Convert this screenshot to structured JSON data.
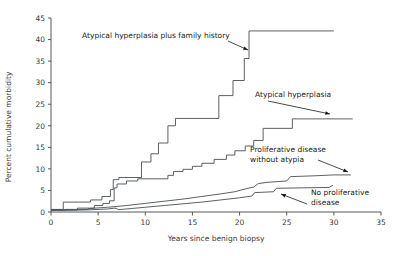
{
  "chart_data": {
    "type": "line",
    "step": true,
    "title": "",
    "xlabel": "Years since benign biopsy",
    "ylabel": "Percent cumulative morbidity",
    "xlim": [
      0,
      35
    ],
    "ylim": [
      0,
      45
    ],
    "xticks": [
      0,
      5,
      10,
      15,
      20,
      25,
      30,
      35
    ],
    "yticks": [
      0,
      5,
      10,
      15,
      20,
      25,
      30,
      35,
      40,
      45
    ],
    "grid": false,
    "legend": "inline annotations with arrows",
    "series": [
      {
        "name": "Atypical hyperplasia plus family history",
        "color": "#4a4e52",
        "points": [
          [
            0,
            0.6
          ],
          [
            1.3,
            0.6
          ],
          [
            1.3,
            2.3
          ],
          [
            4.2,
            2.3
          ],
          [
            4.2,
            2.8
          ],
          [
            5.4,
            2.8
          ],
          [
            5.4,
            3.6
          ],
          [
            6.3,
            3.6
          ],
          [
            6.3,
            5.2
          ],
          [
            6.6,
            5.2
          ],
          [
            6.6,
            7.5
          ],
          [
            7.2,
            7.5
          ],
          [
            7.2,
            8.0
          ],
          [
            9.6,
            8.0
          ],
          [
            9.6,
            11.6
          ],
          [
            10.6,
            11.6
          ],
          [
            10.6,
            13.5
          ],
          [
            11.4,
            13.5
          ],
          [
            11.4,
            16.0
          ],
          [
            12.4,
            16.0
          ],
          [
            12.4,
            20.0
          ],
          [
            13.2,
            20.0
          ],
          [
            13.2,
            21.7
          ],
          [
            17.8,
            21.7
          ],
          [
            17.8,
            27.0
          ],
          [
            19.3,
            27.0
          ],
          [
            19.3,
            30.5
          ],
          [
            20.5,
            30.5
          ],
          [
            20.5,
            35.6
          ],
          [
            21.0,
            35.6
          ],
          [
            21.0,
            42.0
          ],
          [
            30.0,
            42.0
          ]
        ]
      },
      {
        "name": "Atypical hyperplasia",
        "color": "#4a4e52",
        "points": [
          [
            0,
            0.5
          ],
          [
            2.8,
            0.5
          ],
          [
            2.8,
            0.9
          ],
          [
            4.6,
            0.9
          ],
          [
            4.6,
            1.5
          ],
          [
            5.5,
            1.5
          ],
          [
            5.5,
            2.0
          ],
          [
            6.2,
            2.0
          ],
          [
            6.2,
            2.6
          ],
          [
            6.7,
            2.6
          ],
          [
            6.7,
            5.6
          ],
          [
            7.0,
            5.6
          ],
          [
            7.0,
            6.5
          ],
          [
            8.0,
            6.5
          ],
          [
            8.0,
            7.2
          ],
          [
            9.2,
            7.2
          ],
          [
            9.2,
            7.7
          ],
          [
            12.4,
            7.7
          ],
          [
            12.4,
            8.5
          ],
          [
            13.0,
            8.5
          ],
          [
            13.0,
            9.4
          ],
          [
            14.0,
            9.4
          ],
          [
            14.0,
            9.9
          ],
          [
            15.0,
            9.9
          ],
          [
            15.0,
            10.6
          ],
          [
            16.0,
            10.6
          ],
          [
            16.0,
            11.3
          ],
          [
            17.3,
            11.3
          ],
          [
            17.3,
            12.2
          ],
          [
            18.6,
            12.2
          ],
          [
            18.6,
            13.2
          ],
          [
            19.5,
            13.2
          ],
          [
            19.5,
            14.2
          ],
          [
            20.6,
            14.2
          ],
          [
            20.6,
            15.3
          ],
          [
            21.5,
            15.3
          ],
          [
            21.5,
            16.6
          ],
          [
            22.5,
            16.6
          ],
          [
            22.5,
            19.4
          ],
          [
            25.6,
            19.4
          ],
          [
            25.6,
            21.6
          ],
          [
            32.0,
            21.6
          ]
        ]
      },
      {
        "name": "Proliferative disease without atypia",
        "color": "#4a4e52",
        "points": [
          [
            0,
            0.45
          ],
          [
            1.5,
            0.45
          ],
          [
            1.5,
            0.6
          ],
          [
            4.0,
            0.6
          ],
          [
            4.0,
            0.8
          ],
          [
            6.0,
            1.1
          ],
          [
            8.0,
            1.5
          ],
          [
            10.0,
            2.0
          ],
          [
            12.0,
            2.5
          ],
          [
            14.0,
            3.0
          ],
          [
            16.0,
            3.6
          ],
          [
            18.0,
            4.2
          ],
          [
            19.5,
            4.7
          ],
          [
            20.5,
            5.3
          ],
          [
            21.5,
            5.8
          ],
          [
            22.0,
            6.6
          ],
          [
            23.0,
            6.9
          ],
          [
            25.0,
            7.2
          ],
          [
            25.4,
            8.2
          ],
          [
            28.0,
            8.4
          ],
          [
            30.0,
            8.6
          ],
          [
            31.8,
            8.6
          ]
        ]
      },
      {
        "name": "No proliferative disease",
        "color": "#4a4e52",
        "points": [
          [
            0,
            0.4
          ],
          [
            2.0,
            0.4
          ],
          [
            4.0,
            0.5
          ],
          [
            6.0,
            0.7
          ],
          [
            6.8,
            0.9
          ],
          [
            7.2,
            0.55
          ],
          [
            8.5,
            0.8
          ],
          [
            10.0,
            1.1
          ],
          [
            12.0,
            1.5
          ],
          [
            14.0,
            1.9
          ],
          [
            16.0,
            2.3
          ],
          [
            18.0,
            2.8
          ],
          [
            20.0,
            3.3
          ],
          [
            21.3,
            3.7
          ],
          [
            21.6,
            4.5
          ],
          [
            23.6,
            4.7
          ],
          [
            23.9,
            5.5
          ],
          [
            29.5,
            5.7
          ],
          [
            29.9,
            6.2
          ]
        ]
      }
    ],
    "annotations": [
      {
        "id": "ann-atypical-family",
        "text": "Atypical hyperplasia plus family history",
        "text_lines": [
          "Atypical hyperplasia plus family history"
        ],
        "x": 82,
        "y": 38,
        "arrow": {
          "x1": 228,
          "y1": 41,
          "x2": 248,
          "y2": 50
        }
      },
      {
        "id": "ann-atypical",
        "text": "Atypical hyperplasia",
        "text_lines": [
          "Atypical hyperplasia"
        ],
        "x": 255,
        "y": 97,
        "arrow": {
          "x1": 268,
          "y1": 101,
          "x2": 330,
          "y2": 114
        }
      },
      {
        "id": "ann-proliferative",
        "text": "Proliferative disease without atypia",
        "text_lines": [
          "Proliferative disease",
          "without atypia"
        ],
        "x": 250,
        "y": 152,
        "arrow": {
          "x1": 318,
          "y1": 160,
          "x2": 348,
          "y2": 172
        }
      },
      {
        "id": "ann-no-proliferative",
        "text": "No proliferative disease",
        "text_lines": [
          "No proliferative",
          "disease"
        ],
        "x": 311,
        "y": 195,
        "arrow": {
          "x1": 307,
          "y1": 204,
          "x2": 281,
          "y2": 194
        }
      }
    ]
  },
  "axes": {
    "x_tick_labels": [
      "0",
      "5",
      "10",
      "15",
      "20",
      "25",
      "30",
      "35"
    ],
    "y_tick_labels": [
      "0",
      "5",
      "10",
      "15",
      "20",
      "25",
      "30",
      "35",
      "40",
      "45"
    ],
    "x_title": "Years since benign biopsy",
    "y_title": "Percent cumulative morbidity"
  },
  "colors": {
    "background": "#ffffff",
    "axis": "#55595c",
    "line": "#4a4e52",
    "tick_text": "#3a3a3a",
    "annotation_text": "#1a1a1a"
  }
}
